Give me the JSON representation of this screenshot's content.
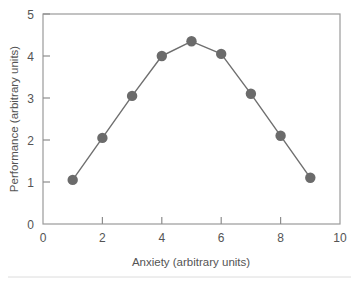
{
  "chart_data": {
    "type": "line",
    "title": "",
    "xlabel": "Anxiety (arbitrary units)",
    "ylabel": "Performance (arbitrary units)",
    "xlim": [
      0,
      10
    ],
    "ylim": [
      0,
      5
    ],
    "xticks": [
      0,
      2,
      4,
      6,
      8,
      10
    ],
    "yticks": [
      0,
      1,
      2,
      3,
      4,
      5
    ],
    "xtick_labels": [
      "0",
      "2",
      "4",
      "6",
      "8",
      "10"
    ],
    "ytick_labels": [
      "0",
      "1",
      "2",
      "3",
      "4",
      "5"
    ],
    "grid": false,
    "legend": false,
    "legend_position": "none",
    "marker": "circle",
    "marker_color": "#6b6b6b",
    "line_color": "#6f6f6f",
    "frame_color": "#9a9a9a",
    "text_color": "#545454",
    "background_color": "#ffffff",
    "x": [
      1,
      2,
      3,
      4,
      5,
      6,
      7,
      8,
      9
    ],
    "values": [
      1.05,
      2.05,
      3.05,
      4.0,
      4.35,
      4.05,
      3.1,
      2.1,
      1.1
    ],
    "series": [
      {
        "name": "Performance vs Anxiety",
        "x": [
          1,
          2,
          3,
          4,
          5,
          6,
          7,
          8,
          9
        ],
        "values": [
          1.05,
          2.05,
          3.05,
          4.0,
          4.35,
          4.05,
          3.1,
          2.1,
          1.1
        ]
      }
    ],
    "annotations": []
  },
  "axes": {
    "x_title": "Anxiety (arbitrary units)",
    "y_title": "Performance (arbitrary units)"
  },
  "ticks": {
    "x": [
      "0",
      "2",
      "4",
      "6",
      "8",
      "10"
    ],
    "y": [
      "0",
      "1",
      "2",
      "3",
      "4",
      "5"
    ]
  }
}
